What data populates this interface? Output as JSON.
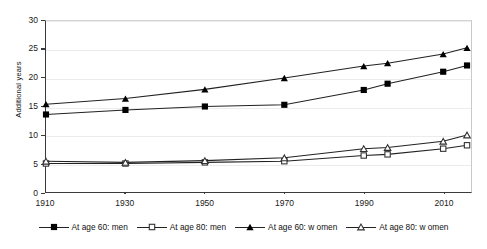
{
  "chart_data": {
    "type": "line",
    "title": "",
    "subtitle": "",
    "xlabel": "",
    "ylabel": "Additional years",
    "xlim": [
      1910,
      2017
    ],
    "ylim": [
      0,
      30
    ],
    "grid": true,
    "legend_position": "bottom",
    "x": [
      1910,
      1930,
      1950,
      1970,
      1990,
      1996,
      2010,
      2016
    ],
    "xticks": [
      "1910",
      "1930",
      "1950",
      "1970",
      "1990",
      "2010"
    ],
    "xtick_values": [
      1910,
      1930,
      1950,
      1970,
      1990,
      2010
    ],
    "yticks": [
      "0",
      "5",
      "10",
      "15",
      "20",
      "25",
      "30"
    ],
    "ytick_values": [
      0,
      5,
      10,
      15,
      20,
      25,
      30
    ],
    "series": [
      {
        "name": "At age 60: men",
        "marker": "filled-square",
        "values": [
          13.6,
          14.4,
          15.0,
          15.3,
          17.9,
          19.0,
          21.1,
          22.2
        ]
      },
      {
        "name": "At age 80: men",
        "marker": "open-square",
        "values": [
          5.0,
          5.0,
          5.2,
          5.4,
          6.4,
          6.6,
          7.6,
          8.2
        ]
      },
      {
        "name": "At age 60: w omen",
        "marker": "filled-triangle",
        "values": [
          15.4,
          16.4,
          18.0,
          20.0,
          22.1,
          22.6,
          24.2,
          25.3
        ]
      },
      {
        "name": "At age 80: w omen",
        "marker": "open-triangle",
        "values": [
          5.4,
          5.2,
          5.5,
          6.0,
          7.6,
          7.8,
          8.9,
          10.0
        ]
      }
    ]
  },
  "legend": {
    "items": [
      {
        "label": "At age 60: men"
      },
      {
        "label": "At age 80: men"
      },
      {
        "label": "At age 60: w omen"
      },
      {
        "label": "At age 80: w omen"
      }
    ]
  },
  "colors": {
    "line": "#222222",
    "axis": "#3a3a3a",
    "grid": "#ececec",
    "background": "#ffffff"
  }
}
